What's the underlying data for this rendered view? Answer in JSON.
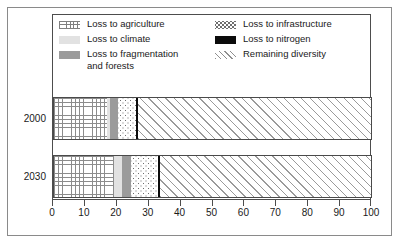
{
  "chart_data": {
    "type": "bar",
    "orientation": "horizontal",
    "stacked": true,
    "title": "",
    "subtitle": "",
    "xlabel": "",
    "ylabel": "",
    "xlim": [
      0,
      100
    ],
    "xticks": [
      0,
      10,
      20,
      30,
      40,
      50,
      60,
      70,
      80,
      90,
      100
    ],
    "xticklabels": [
      "0",
      "10",
      "20",
      "30",
      "40",
      "50",
      "60",
      "70",
      "80",
      "90",
      "100"
    ],
    "grid": false,
    "legend_position": "top-inside",
    "categories": [
      "2000",
      "2030"
    ],
    "series": [
      {
        "name": "Loss to agriculture",
        "values": [
          17,
          19
        ],
        "pattern": "grid",
        "color": "#ffffff"
      },
      {
        "name": "Loss to climate",
        "values": [
          1,
          2.5
        ],
        "pattern": "solid-light",
        "color": "#e2e2e2"
      },
      {
        "name": "Loss to fragmentation and forests",
        "values": [
          2.5,
          3
        ],
        "pattern": "solid-gray",
        "color": "#9b9b9b"
      },
      {
        "name": "Loss to infrastructure",
        "values": [
          5.5,
          8.5
        ],
        "pattern": "dots",
        "color": "#ffffff"
      },
      {
        "name": "Loss to nitrogen",
        "values": [
          0.5,
          0.5
        ],
        "pattern": "solid-black",
        "color": "#0b0b0b"
      },
      {
        "name": "Remaining diversity",
        "values": [
          73.5,
          66.5
        ],
        "pattern": "diagonal-hatch",
        "color": "#ffffff"
      }
    ]
  },
  "legend": {
    "columns": [
      {
        "items": [
          {
            "label": "Loss to agriculture",
            "swatch": "grid-swatch"
          },
          {
            "label": "Loss to climate",
            "swatch": "light-gray-swatch"
          },
          {
            "label": "Loss to fragmentation\nand forests",
            "swatch": "dark-gray-swatch"
          }
        ]
      },
      {
        "items": [
          {
            "label": "Loss to infrastructure",
            "swatch": "dotted-swatch"
          },
          {
            "label": "Loss to nitrogen",
            "swatch": "black-swatch"
          },
          {
            "label": "Remaining diversity",
            "swatch": "hatch-swatch"
          }
        ]
      }
    ]
  },
  "axis": {
    "y_categories": [
      "2000",
      "2030"
    ],
    "x_ticklabels": [
      "0",
      "10",
      "20",
      "30",
      "40",
      "50",
      "60",
      "70",
      "80",
      "90",
      "100"
    ]
  }
}
